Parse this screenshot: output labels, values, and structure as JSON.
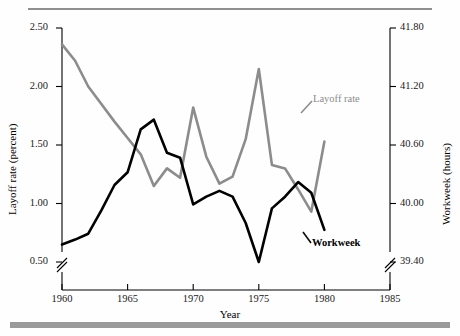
{
  "chart_data": {
    "type": "line",
    "title": "",
    "xlabel": "Year",
    "ylabel": "Layoff rate (percent)",
    "y2label": "Workweek (hours)",
    "xlim": [
      1960,
      1985
    ],
    "ylim": [
      0.5,
      2.5
    ],
    "y2lim": [
      39.4,
      41.8
    ],
    "grid": false,
    "legend_position": "inline-annotations",
    "axis_break_left": true,
    "axis_break_right": true,
    "xticks": [
      "1960",
      "1965",
      "1970",
      "1975",
      "1980",
      "1985"
    ],
    "yticks": [
      "0.50",
      "1.00",
      "1.50",
      "2.00",
      "2.50"
    ],
    "y2ticks": [
      "39.40",
      "40.00",
      "40.60",
      "41.20",
      "41.80"
    ],
    "series": [
      {
        "name": "Layoff rate",
        "axis": "left",
        "color": "#8c8c8c",
        "x": [
          1960,
          1961,
          1962,
          1963,
          1964,
          1965,
          1966,
          1967,
          1968,
          1969,
          1970,
          1971,
          1972,
          1973,
          1974,
          1975,
          1976,
          1977,
          1978,
          1979,
          1980
        ],
        "values": [
          2.36,
          2.22,
          2.0,
          1.85,
          1.7,
          1.56,
          1.42,
          1.15,
          1.3,
          1.22,
          1.82,
          1.4,
          1.17,
          1.23,
          1.55,
          2.15,
          1.33,
          1.3,
          1.12,
          0.93,
          1.53
        ]
      },
      {
        "name": "Workweek",
        "axis": "right",
        "color": "#000000",
        "x": [
          1960,
          1961,
          1962,
          1963,
          1964,
          1965,
          1966,
          1967,
          1968,
          1969,
          1970,
          1971,
          1972,
          1973,
          1974,
          1975,
          1976,
          1977,
          1978,
          1979,
          1980
        ],
        "values": [
          39.58,
          39.63,
          39.69,
          39.93,
          40.19,
          40.32,
          40.76,
          40.86,
          40.52,
          40.47,
          39.99,
          40.07,
          40.13,
          40.07,
          39.8,
          39.4,
          39.95,
          40.07,
          40.22,
          40.11,
          39.73
        ]
      }
    ],
    "values_left_scale": {
      "layoff_rate": [
        2.36,
        2.22,
        2.0,
        1.85,
        1.7,
        1.56,
        1.42,
        1.15,
        1.3,
        1.22,
        1.82,
        1.4,
        1.17,
        1.23,
        1.55,
        2.15,
        1.33,
        1.3,
        1.12,
        0.93,
        1.53
      ],
      "workweek_as_left": [
        0.73,
        0.77,
        0.82,
        1.02,
        1.24,
        1.35,
        1.72,
        1.8,
        1.52,
        1.48,
        1.08,
        1.14,
        1.19,
        1.14,
        0.91,
        0.5,
        0.96,
        1.06,
        1.18,
        1.09,
        0.78
      ]
    },
    "annotations": [
      {
        "text": "Layoff rate",
        "color": "#8c8c8c",
        "bold": false
      },
      {
        "text": "Workweek",
        "color": "#000000",
        "bold": true
      }
    ]
  },
  "axes": {
    "x_title": "Year",
    "y_left_title": "Layoff rate (percent)",
    "y_right_title": "Workweek (hours)"
  },
  "ticks": {
    "x": [
      "1960",
      "1965",
      "1970",
      "1975",
      "1980",
      "1985"
    ],
    "y_left": [
      "2.50",
      "2.00",
      "1.50",
      "1.00",
      "0.50"
    ],
    "y_right": [
      "41.80",
      "41.20",
      "40.60",
      "40.00",
      "39.40"
    ]
  },
  "labels": {
    "layoff": "Layoff rate",
    "workweek": "Workweek"
  }
}
